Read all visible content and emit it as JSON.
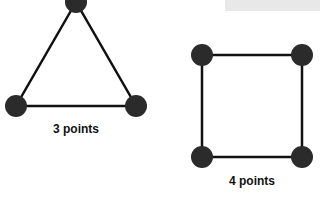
{
  "diagrams": [
    {
      "shape": "triangle",
      "label": "3 points",
      "points": [
        [
          76,
          2
        ],
        [
          16,
          106
        ],
        [
          136,
          106
        ]
      ]
    },
    {
      "shape": "square",
      "label": "4 points",
      "points": [
        [
          202,
          55
        ],
        [
          302,
          55
        ],
        [
          302,
          157
        ],
        [
          202,
          157
        ]
      ]
    }
  ],
  "colors": {
    "node": "#2b2b2b",
    "edge": "#111111",
    "panel": "#e8e8e8"
  }
}
